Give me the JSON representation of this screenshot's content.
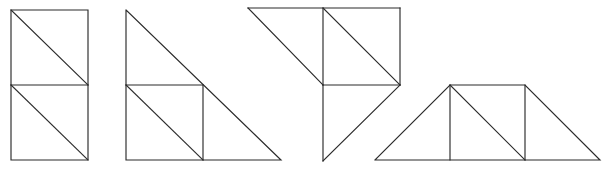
{
  "document": {
    "title": "Geometric Dissection Figures",
    "description": "Four line-drawn geometric figures composed of unit squares and right isosceles triangles",
    "background_color": "#ffffff",
    "stroke_color": "#2b2b2b",
    "stroke_width": 1.15,
    "canvas": {
      "width": 614,
      "height": 173
    }
  },
  "figures": [
    {
      "id": "figure-1",
      "name": "stacked-squares-with-diagonals",
      "label": "Two stacked squares each split by a diagonal",
      "unit": 75,
      "segments": [
        {
          "name": "outer-rectangle",
          "points": "11,10 88,10 88,160 11,160 11,10"
        },
        {
          "name": "middle-horizontal",
          "points": "11,85 88,85"
        },
        {
          "name": "upper-square-diagonal",
          "points": "11,10 88,85"
        },
        {
          "name": "lower-square-diagonal",
          "points": "11,85 88,160"
        }
      ]
    },
    {
      "id": "figure-2",
      "name": "large-right-triangle-with-inscribed-square",
      "label": "Large right triangle containing a square with a diagonal",
      "unit": 75,
      "segments": [
        {
          "name": "triangle-outline",
          "points": "126,10 281,160 126,160 126,10"
        },
        {
          "name": "square-top-edge",
          "points": "126,85 203,85"
        },
        {
          "name": "square-right-edge",
          "points": "203,85 203,160"
        },
        {
          "name": "square-diagonal",
          "points": "126,85 203,160"
        }
      ]
    },
    {
      "id": "figure-3",
      "name": "arrow-shaped-composite",
      "label": "Arrow-like composite of a square and three right triangles",
      "unit": 77,
      "segments": [
        {
          "name": "top-horizontal",
          "points": "248,8 400,8"
        },
        {
          "name": "upper-left-diagonal",
          "points": "248,8 323,85"
        },
        {
          "name": "square-left-edge",
          "points": "323,8 323,85"
        },
        {
          "name": "square-right-edge",
          "points": "400,8 400,85"
        },
        {
          "name": "square-diagonal",
          "points": "323,8 400,85"
        },
        {
          "name": "middle-horizontal",
          "points": "323,85 400,85"
        },
        {
          "name": "lower-vertical",
          "points": "323,85 323,161"
        },
        {
          "name": "lower-diagonal",
          "points": "323,161 400,85"
        }
      ]
    },
    {
      "id": "figure-4",
      "name": "trapezoid-with-square-and-triangles",
      "label": "Trapezoid divided into two end triangles, a triangle and a square",
      "unit": 75,
      "segments": [
        {
          "name": "trapezoid-outline",
          "points": "375,160 450,85 525,85 600,160 375,160"
        },
        {
          "name": "left-inner-vertical",
          "points": "450,85 450,160"
        },
        {
          "name": "right-inner-vertical",
          "points": "525,85 525,160"
        },
        {
          "name": "inner-square-diagonal",
          "points": "450,85 525,160"
        }
      ]
    }
  ]
}
